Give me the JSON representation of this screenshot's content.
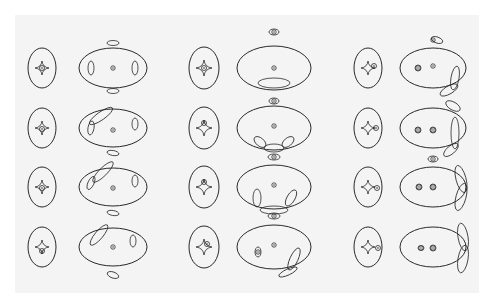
{
  "figure": {
    "background": "#ffffff",
    "panel_color": "#f4f4f4",
    "stroke_color": "#2a2a2a",
    "panel": {
      "x": 15,
      "y": 15,
      "w": 464,
      "h": 278
    },
    "columns": [
      {
        "caustic_x": 42,
        "critical_x": 113
      },
      {
        "caustic_x": 204,
        "critical_x": 274
      },
      {
        "caustic_x": 368,
        "critical_x": 433
      }
    ],
    "rows_y": [
      68,
      128,
      187,
      247
    ],
    "cells": [
      {
        "col": 0,
        "row": 0,
        "caustic": {
          "rx": 14,
          "ry": 20,
          "astroid": 7,
          "shift": [
            0,
            0
          ],
          "ring": true
        },
        "critical": {
          "rx": 34,
          "ry": 20,
          "dots": [
            [
              0,
              0
            ]
          ],
          "ovals": [
            [
              -22,
              0,
              3,
              7,
              0
            ],
            [
              22,
              0,
              3,
              7,
              0
            ],
            [
              0,
              -25,
              6,
              2.5,
              0
            ],
            [
              0,
              23,
              6,
              2.5,
              0
            ]
          ]
        }
      },
      {
        "col": 0,
        "row": 1,
        "caustic": {
          "rx": 14,
          "ry": 20,
          "astroid": 7,
          "shift": [
            0,
            1
          ],
          "ring": true
        },
        "critical": {
          "rx": 34,
          "ry": 19,
          "dots": [
            [
              0,
              2
            ]
          ],
          "ovals": [
            [
              -22,
              0,
              3,
              7,
              10
            ],
            [
              22,
              -4,
              3,
              6,
              0
            ],
            [
              -12,
              -12,
              14,
              4,
              -35
            ],
            [
              0,
              25,
              6,
              2.5,
              10
            ]
          ]
        }
      },
      {
        "col": 0,
        "row": 2,
        "caustic": {
          "rx": 14,
          "ry": 20,
          "astroid": 7,
          "shift": [
            0,
            1
          ],
          "ring": true
        },
        "critical": {
          "rx": 34,
          "ry": 19,
          "dots": [
            [
              0,
              1
            ]
          ],
          "ovals": [
            [
              -22,
              -4,
              3,
              7,
              25
            ],
            [
              22,
              -6,
              3,
              6,
              0
            ],
            [
              -10,
              -15,
              14,
              4,
              -45
            ],
            [
              0,
              26,
              6,
              2.5,
              10
            ]
          ]
        }
      },
      {
        "col": 0,
        "row": 3,
        "caustic": {
          "rx": 14,
          "ry": 20,
          "astroid": 7,
          "shift": [
            0,
            4
          ],
          "ring": true
        },
        "critical": {
          "rx": 34,
          "ry": 19,
          "dots": [
            [
              0,
              0
            ]
          ],
          "ovals": [
            [
              20,
              -6,
              3,
              6,
              0
            ],
            [
              -14,
              -12,
              13,
              4,
              -50
            ],
            [
              0,
              28,
              6,
              3,
              20
            ]
          ]
        }
      },
      {
        "col": 1,
        "row": 0,
        "caustic": {
          "rx": 15,
          "ry": 21,
          "astroid": 8,
          "shift": [
            0,
            0
          ],
          "ring": true
        },
        "critical": {
          "rx": 37,
          "ry": 22,
          "dots": [
            [
              0,
              0
            ],
            [
              0,
              -36
            ]
          ],
          "ovals": [
            [
              0,
              -36,
              5,
              3,
              0
            ],
            [
              0,
              15,
              16,
              5,
              0
            ]
          ]
        }
      },
      {
        "col": 1,
        "row": 1,
        "caustic": {
          "rx": 15,
          "ry": 21,
          "astroid": 8,
          "shift": [
            0,
            -5
          ],
          "ring": true
        },
        "critical": {
          "rx": 37,
          "ry": 22,
          "dots": [
            [
              0,
              -2
            ],
            [
              0,
              -27
            ]
          ],
          "ovals": [
            [
              0,
              -27,
              5,
              3,
              0
            ],
            [
              -14,
              14,
              7,
              4,
              40
            ],
            [
              14,
              14,
              7,
              4,
              -40
            ],
            [
              0,
              20,
              10,
              4,
              0
            ]
          ]
        }
      },
      {
        "col": 1,
        "row": 2,
        "caustic": {
          "rx": 15,
          "ry": 21,
          "astroid": 8,
          "shift": [
            0,
            -5
          ],
          "ring": true
        },
        "critical": {
          "rx": 37,
          "ry": 22,
          "dots": [
            [
              0,
              -2
            ],
            [
              0,
              -30
            ]
          ],
          "ovals": [
            [
              0,
              -30,
              6,
              3,
              0
            ],
            [
              -17,
              11,
              4,
              9,
              0
            ],
            [
              17,
              11,
              4,
              9,
              30
            ],
            [
              0,
              23,
              14,
              4,
              0
            ]
          ]
        }
      },
      {
        "col": 1,
        "row": 3,
        "caustic": {
          "rx": 15,
          "ry": 21,
          "astroid": 8,
          "shift": [
            3,
            -3
          ],
          "ring": true
        },
        "critical": {
          "rx": 37,
          "ry": 22,
          "dots": [
            [
              0,
              -2
            ],
            [
              -16,
              5
            ],
            [
              0,
              -31
            ]
          ],
          "ovals": [
            [
              0,
              -31,
              6,
              3,
              0
            ],
            [
              -16,
              5,
              3,
              5,
              0
            ],
            [
              20,
              12,
              4,
              12,
              25
            ],
            [
              14,
              25,
              10,
              3,
              -25
            ]
          ]
        }
      },
      {
        "col": 2,
        "row": 0,
        "caustic": {
          "rx": 14,
          "ry": 20,
          "astroid": 7,
          "shift": [
            0,
            0
          ],
          "ring": true,
          "ring_shift": [
            6,
            -2
          ]
        },
        "critical": {
          "rx": 33,
          "ry": 20,
          "dots": [
            [
              -15,
              0
            ],
            [
              0,
              -2
            ],
            [
              0,
              -28
            ]
          ],
          "ovals": [
            [
              -15,
              0,
              3,
              3,
              0
            ],
            [
              4,
              -28,
              6,
              3,
              20
            ],
            [
              22,
              10,
              4,
              12,
              10
            ],
            [
              16,
              22,
              10,
              4,
              -30
            ]
          ]
        }
      },
      {
        "col": 2,
        "row": 1,
        "caustic": {
          "rx": 14,
          "ry": 20,
          "astroid": 7,
          "shift": [
            0,
            0
          ],
          "ring": true,
          "ring_shift": [
            8,
            0
          ]
        },
        "critical": {
          "rx": 33,
          "ry": 20,
          "dots": [
            [
              -15,
              2
            ],
            [
              0,
              2
            ]
          ],
          "ovals": [
            [
              -15,
              2,
              3,
              3,
              0
            ],
            [
              0,
              2,
              3,
              3,
              0
            ],
            [
              20,
              -22,
              8,
              4,
              30
            ],
            [
              22,
              5,
              4,
              16,
              0
            ],
            [
              18,
              22,
              9,
              4,
              -40
            ]
          ]
        }
      },
      {
        "col": 2,
        "row": 2,
        "caustic": {
          "rx": 14,
          "ry": 20,
          "astroid": 7,
          "shift": [
            0,
            0
          ],
          "ring": true,
          "ring_shift": [
            9,
            1
          ]
        },
        "critical": {
          "rx": 33,
          "ry": 20,
          "dots": [
            [
              -14,
              0
            ],
            [
              0,
              0
            ],
            [
              0,
              -28
            ]
          ],
          "ovals": [
            [
              -14,
              0,
              3,
              3,
              0
            ],
            [
              0,
              0,
              3,
              3,
              0
            ],
            [
              0,
              -28,
              5,
              3,
              0
            ],
            [
              28,
              -8,
              5,
              14,
              -15
            ],
            [
              28,
              10,
              5,
              14,
              15
            ]
          ]
        }
      },
      {
        "col": 2,
        "row": 3,
        "caustic": {
          "rx": 14,
          "ry": 20,
          "astroid": 7,
          "shift": [
            0,
            0
          ],
          "ring": true,
          "ring_shift": [
            10,
            1
          ]
        },
        "critical": {
          "rx": 33,
          "ry": 20,
          "dots": [
            [
              -12,
              1
            ],
            [
              0,
              1
            ]
          ],
          "ovals": [
            [
              -12,
              1,
              3,
              2.5,
              0
            ],
            [
              0,
              1,
              3,
              3,
              0
            ],
            [
              30,
              -10,
              5,
              14,
              -10
            ],
            [
              30,
              12,
              5,
              14,
              10
            ]
          ]
        }
      }
    ]
  }
}
